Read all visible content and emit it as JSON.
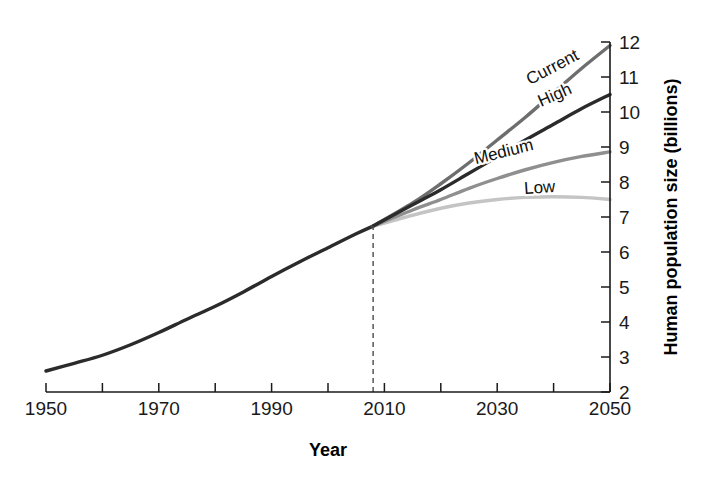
{
  "chart_data": {
    "type": "line",
    "title": "",
    "xlabel": "Year",
    "ylabel": "Human population size (billions)",
    "xlim": [
      1950,
      2050
    ],
    "ylim": [
      2,
      12
    ],
    "xticks": [
      1950,
      1960,
      1970,
      1980,
      1990,
      2000,
      2010,
      2020,
      2030,
      2040,
      2050
    ],
    "xtick_labels": [
      "1950",
      "",
      "1970",
      "",
      "1990",
      "",
      "2010",
      "",
      "2030",
      "",
      "2050"
    ],
    "yticks": [
      2,
      3,
      4,
      5,
      6,
      7,
      8,
      9,
      10,
      11,
      12
    ],
    "ytick_labels": [
      "2",
      "3",
      "4",
      "5",
      "6",
      "7",
      "8",
      "9",
      "10",
      "11",
      "12"
    ],
    "grid": false,
    "legend_position": "inline-end-of-line",
    "annotations": [
      {
        "name": "projection-start-guide",
        "type": "vertical-dashed-line",
        "x": 2008,
        "y_from": 2,
        "y_to": 6.74,
        "label": ""
      }
    ],
    "branch_point": {
      "x": 2008,
      "y": 6.74
    },
    "series": [
      {
        "name": "Historic",
        "label": "",
        "color": "#2b2b2b",
        "width": 3.4,
        "x": [
          1950,
          1955,
          1960,
          1965,
          1970,
          1975,
          1980,
          1985,
          1990,
          1995,
          2000,
          2005,
          2008
        ],
        "values": [
          2.6,
          2.82,
          3.05,
          3.35,
          3.7,
          4.08,
          4.45,
          4.86,
          5.3,
          5.72,
          6.12,
          6.52,
          6.74
        ]
      },
      {
        "name": "Current",
        "label": "Current",
        "color": "#6e6e6e",
        "width": 3.4,
        "x": [
          2008,
          2015,
          2020,
          2025,
          2030,
          2035,
          2040,
          2045,
          2050
        ],
        "values": [
          6.74,
          7.4,
          7.95,
          8.55,
          9.2,
          9.85,
          10.55,
          11.25,
          11.9
        ]
      },
      {
        "name": "High",
        "label": "High",
        "color": "#2b2b2b",
        "width": 3.4,
        "x": [
          2008,
          2015,
          2020,
          2025,
          2030,
          2035,
          2040,
          2045,
          2050
        ],
        "values": [
          6.74,
          7.35,
          7.78,
          8.25,
          8.72,
          9.2,
          9.65,
          10.1,
          10.5
        ]
      },
      {
        "name": "Medium",
        "label": "Medium",
        "color": "#8f8f8f",
        "width": 3.4,
        "x": [
          2008,
          2015,
          2020,
          2025,
          2030,
          2035,
          2040,
          2045,
          2050
        ],
        "values": [
          6.74,
          7.2,
          7.5,
          7.82,
          8.1,
          8.35,
          8.56,
          8.73,
          8.86
        ]
      },
      {
        "name": "Low",
        "label": "Low",
        "color": "#c4c4c4",
        "width": 3.4,
        "x": [
          2008,
          2015,
          2020,
          2025,
          2030,
          2035,
          2040,
          2045,
          2050
        ],
        "values": [
          6.74,
          7.05,
          7.25,
          7.4,
          7.5,
          7.56,
          7.58,
          7.56,
          7.5
        ]
      }
    ],
    "series_labels": [
      {
        "name": "Current",
        "text": "Current",
        "x": 555,
        "y": 72,
        "rotate": -28
      },
      {
        "name": "High",
        "text": "High",
        "x": 557,
        "y": 100,
        "rotate": -24
      },
      {
        "name": "Medium",
        "text": "Medium",
        "x": 505,
        "y": 157,
        "rotate": -14
      },
      {
        "name": "Low",
        "text": "Low",
        "x": 540,
        "y": 193,
        "rotate": -4
      }
    ]
  }
}
